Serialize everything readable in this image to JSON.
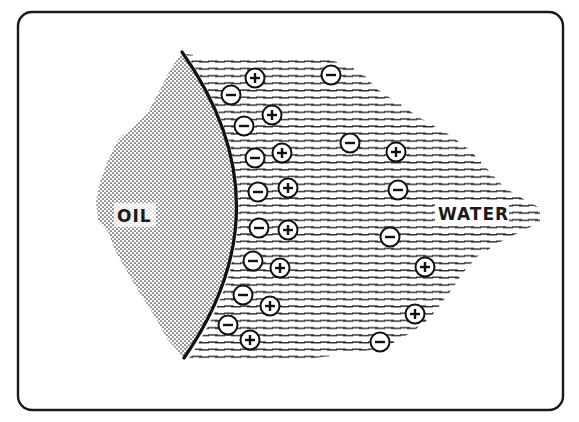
{
  "diagram": {
    "type": "oil-water interface electric double layer",
    "labels": {
      "oil": "OIL",
      "water": "WATER"
    },
    "colors": {
      "ink": "#1a1a1a",
      "background": "#ffffff",
      "oil_dot": "#333333",
      "water_dash": "#2a2a2a"
    },
    "frame": {
      "x": 18,
      "y": 12,
      "width": 545,
      "height": 398,
      "radius": 14
    },
    "interface_curve": "M 182 52 Q 290 205 184 358",
    "ions": {
      "interface_negative": [
        {
          "x": 231,
          "y": 95,
          "sign": "-"
        },
        {
          "x": 244,
          "y": 126,
          "sign": "-"
        },
        {
          "x": 255,
          "y": 158,
          "sign": "-"
        },
        {
          "x": 258,
          "y": 192,
          "sign": "-"
        },
        {
          "x": 259,
          "y": 228,
          "sign": "-"
        },
        {
          "x": 253,
          "y": 261,
          "sign": "-"
        },
        {
          "x": 243,
          "y": 295,
          "sign": "-"
        },
        {
          "x": 228,
          "y": 325,
          "sign": "-"
        }
      ],
      "counter_positive": [
        {
          "x": 255,
          "y": 78,
          "sign": "+"
        },
        {
          "x": 272,
          "y": 115,
          "sign": "+"
        },
        {
          "x": 282,
          "y": 153,
          "sign": "+"
        },
        {
          "x": 288,
          "y": 188,
          "sign": "+"
        },
        {
          "x": 288,
          "y": 230,
          "sign": "+"
        },
        {
          "x": 280,
          "y": 268,
          "sign": "+"
        },
        {
          "x": 270,
          "y": 306,
          "sign": "+"
        },
        {
          "x": 250,
          "y": 340,
          "sign": "+"
        }
      ],
      "bulk": [
        {
          "x": 331,
          "y": 75,
          "sign": "-"
        },
        {
          "x": 350,
          "y": 143,
          "sign": "-"
        },
        {
          "x": 396,
          "y": 152,
          "sign": "+"
        },
        {
          "x": 398,
          "y": 190,
          "sign": "-"
        },
        {
          "x": 390,
          "y": 237,
          "sign": "-"
        },
        {
          "x": 425,
          "y": 267,
          "sign": "+"
        },
        {
          "x": 415,
          "y": 314,
          "sign": "+"
        },
        {
          "x": 380,
          "y": 342,
          "sign": "-"
        }
      ]
    }
  }
}
